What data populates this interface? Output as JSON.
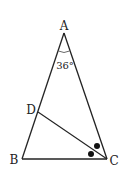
{
  "diagram": {
    "type": "triangle",
    "vertices": {
      "A": {
        "label": "A",
        "x": 64,
        "y": 33
      },
      "B": {
        "label": "B",
        "x": 22,
        "y": 159
      },
      "C": {
        "label": "C",
        "x": 107,
        "y": 159
      },
      "D": {
        "label": "D",
        "x": 38,
        "y": 112
      }
    },
    "angle_label": "36°",
    "segments": [
      "AB",
      "AC",
      "BC",
      "CD"
    ],
    "markers": "two equal-angle dots at C (CD bisects angle ACB)",
    "colors": {
      "stroke": "#222222",
      "background": "#ffffff"
    }
  }
}
